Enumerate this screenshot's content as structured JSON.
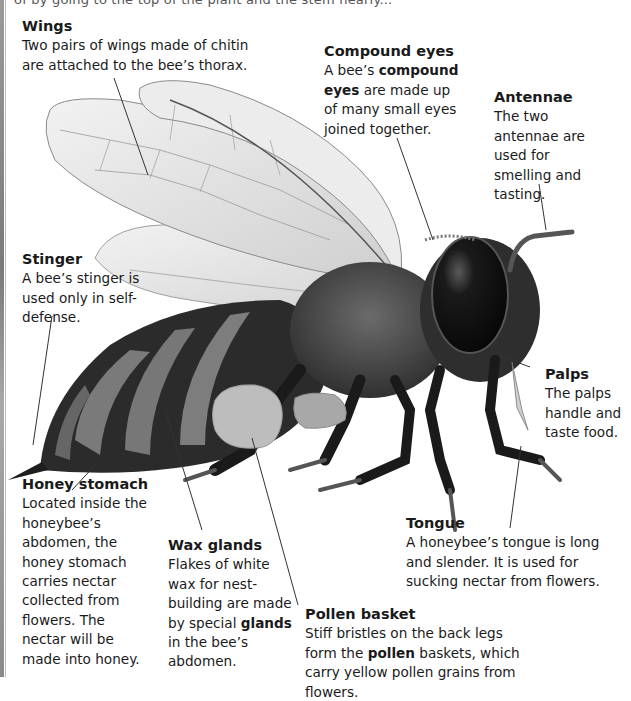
{
  "header": {
    "cutoff_line": "of by going to the top of the plant and the stem nearly..."
  },
  "labels": {
    "wings": {
      "title": "Wings",
      "text": "Two pairs of wings made of chitin are attached to the bee’s thorax."
    },
    "compound_eyes": {
      "title": "Compound eyes",
      "text_pre": "A bee’s ",
      "text_bold": "compound eyes",
      "text_post": " are made up of many small eyes joined together."
    },
    "antennae": {
      "title": "Antennae",
      "text": "The two antennae are used for smelling and tasting."
    },
    "stinger": {
      "title": "Stinger",
      "text": "A bee’s stinger is used only in self-defense."
    },
    "palps": {
      "title": "Palps",
      "text": "The palps handle and taste food."
    },
    "honey_stomach": {
      "title": "Honey stomach",
      "text": "Located inside the honeybee’s abdomen, the honey stomach carries nectar collected from flowers. The nectar will be made into honey."
    },
    "wax_glands": {
      "title": "Wax glands",
      "text_pre": "Flakes of white wax for nest-building are made by special ",
      "text_bold": "glands",
      "text_post": " in the bee’s abdomen."
    },
    "tongue": {
      "title": "Tongue",
      "text": "A honeybee’s tongue is long and slender. It is used for sucking nectar from flowers."
    },
    "pollen_basket": {
      "title": "Pollen basket",
      "text_pre": "Stiff bristles on the back legs form the ",
      "text_bold": "pollen",
      "text_post": " baskets, which carry yellow pollen grains from flowers."
    }
  },
  "illustration": {
    "subject": "honeybee-side-view",
    "palette": {
      "body": "#2a2a2a",
      "band_light": "#7d7d7d",
      "wing": "#e4e4e4",
      "wing_vein": "#9a9a9a",
      "eye": "#0d0d0d",
      "pollen": "#bdbdbd",
      "leader_line": "#333333"
    }
  }
}
